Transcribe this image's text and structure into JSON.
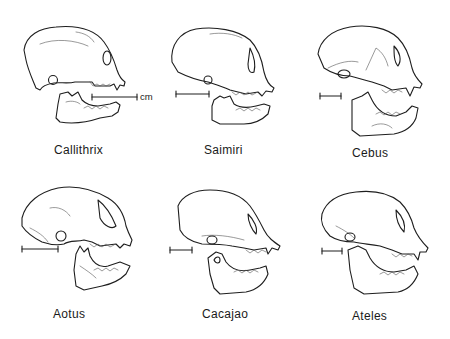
{
  "figure": {
    "background": "#ffffff",
    "ink_color": "#1e1e1e",
    "scale_unit": "cm",
    "panels": [
      {
        "genus": "Callithrix",
        "row": 1,
        "col": 1
      },
      {
        "genus": "Saimiri",
        "row": 1,
        "col": 2
      },
      {
        "genus": "Cebus",
        "row": 1,
        "col": 3
      },
      {
        "genus": "Aotus",
        "row": 2,
        "col": 1
      },
      {
        "genus": "Cacajao",
        "row": 2,
        "col": 2
      },
      {
        "genus": "Ateles",
        "row": 2,
        "col": 3
      }
    ]
  }
}
